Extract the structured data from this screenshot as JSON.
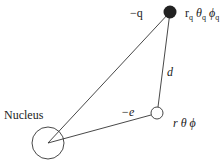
{
  "diagram": {
    "nucleus_label": "Nucleus",
    "charge_label": "−q",
    "electron_label": "−e",
    "distance_label": "d",
    "charge_coords": {
      "r": "r",
      "r_sub": "q",
      "theta": "θ",
      "theta_sub": "q",
      "phi": "ϕ",
      "phi_sub": "q"
    },
    "electron_coords": "r θ  ϕ"
  },
  "colors": {
    "stroke": "#333333",
    "fill": "#222222"
  }
}
